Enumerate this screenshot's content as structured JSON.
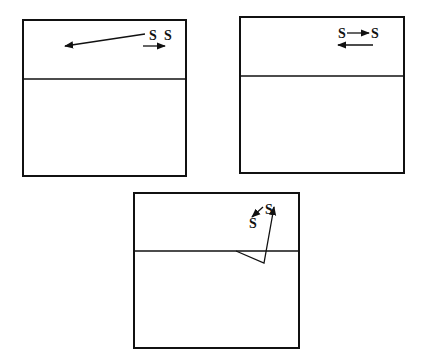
{
  "diagram": {
    "panels": [
      {
        "id": "panel-a",
        "box": {
          "x": 23,
          "y": 20,
          "w": 163,
          "h": 156
        },
        "interface_y": 79,
        "labels": [
          {
            "text": "S",
            "x": 149,
            "y": 40
          },
          {
            "text": "S",
            "x": 164,
            "y": 40
          }
        ],
        "arrows": [
          {
            "x1": 145,
            "y1": 34,
            "x2": 65,
            "y2": 46
          },
          {
            "x1": 143,
            "y1": 46,
            "x2": 165,
            "y2": 46
          }
        ]
      },
      {
        "id": "panel-b",
        "box": {
          "x": 240,
          "y": 17,
          "w": 164,
          "h": 156
        },
        "interface_y": 76,
        "labels": [
          {
            "text": "S",
            "x": 338,
            "y": 38
          },
          {
            "text": "S",
            "x": 371,
            "y": 38
          }
        ],
        "arrows": [
          {
            "x1": 347,
            "y1": 33,
            "x2": 369,
            "y2": 33
          },
          {
            "x1": 373,
            "y1": 45,
            "x2": 338,
            "y2": 45
          }
        ]
      },
      {
        "id": "panel-c",
        "box": {
          "x": 134,
          "y": 193,
          "w": 165,
          "h": 155
        },
        "interface_y": 251,
        "labels": [
          {
            "text": "S",
            "x": 265,
            "y": 214
          },
          {
            "text": "S",
            "x": 249,
            "y": 228
          }
        ],
        "arrows": [
          {
            "x1": 263,
            "y1": 207,
            "x2": 252,
            "y2": 217
          }
        ],
        "polyline_arrow": [
          [
            236,
            251
          ],
          [
            264,
            263
          ],
          [
            274,
            207
          ]
        ]
      }
    ],
    "colors": {
      "stroke": "#111111",
      "background": "#ffffff"
    }
  }
}
